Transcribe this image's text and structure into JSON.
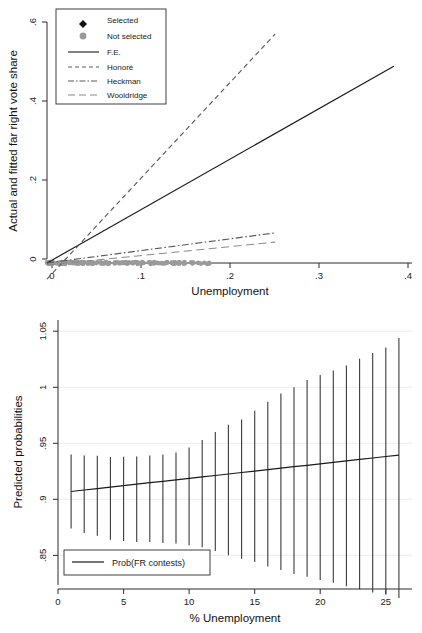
{
  "figure": {
    "caption_partial": "FIGURE 1  Estimates of vote share and contest"
  },
  "chart_data": [
    {
      "type": "scatter",
      "panel": "top",
      "title": "",
      "xlabel": "Unemployment",
      "ylabel": "Actual and fitted far right vote share",
      "xlim": [
        0,
        0.4
      ],
      "ylim": [
        0,
        0.6
      ],
      "xticks": [
        0,
        0.1,
        0.2,
        0.3,
        0.4
      ],
      "xticklabels": [
        "0",
        ".1",
        ".2",
        ".3",
        ".4"
      ],
      "yticks": [
        0,
        0.2,
        0.4,
        0.6
      ],
      "yticklabels": [
        "0",
        ".2",
        ".4",
        ".6"
      ],
      "grid": false,
      "legend_position": "top-left",
      "legend": [
        {
          "label": "Selected",
          "marker": "diamond",
          "color": "#111111"
        },
        {
          "label": "Not selected",
          "marker": "circle",
          "color": "#9a9a9a"
        },
        {
          "label": "F.E.",
          "marker": "line-solid",
          "color": "#1a1a1a"
        },
        {
          "label": "Honoré",
          "marker": "line-dashed",
          "color": "#5a5a5a"
        },
        {
          "label": "Heckman",
          "marker": "line-dashdot",
          "color": "#5a5a5a"
        },
        {
          "label": "Wooldridge",
          "marker": "line-longdash",
          "color": "#8a8a8a"
        }
      ],
      "fit_lines": [
        {
          "name": "F.E.",
          "style": "solid",
          "x": [
            0.0,
            0.38
          ],
          "y": [
            0.0,
            0.49
          ]
        },
        {
          "name": "Honoré",
          "style": "dashed",
          "x": [
            0.0,
            0.25
          ],
          "y": [
            -0.04,
            0.57
          ]
        },
        {
          "name": "Heckman",
          "style": "dashdot",
          "x": [
            0.0,
            0.25
          ],
          "y": [
            0.0,
            0.075
          ]
        },
        {
          "name": "Wooldridge",
          "style": "longdash",
          "x": [
            0.0,
            0.25
          ],
          "y": [
            -0.005,
            0.052
          ]
        }
      ],
      "series": [
        {
          "name": "Selected",
          "marker": "diamond",
          "color": "#111111",
          "n_points": 640,
          "note": "dense cluster at low unemployment, vote share 0 to .36; sparse tail to x=.21"
        },
        {
          "name": "Not selected",
          "marker": "circle",
          "color": "#9a9a9a",
          "n_points": 150,
          "note": "all lie on y = 0 baseline, x from 0 to .19"
        }
      ]
    },
    {
      "type": "line",
      "panel": "bottom",
      "title": "",
      "xlabel": "% Unemployment",
      "ylabel": "Predicted probabilities",
      "xlim": [
        0,
        27
      ],
      "ylim": [
        0.82,
        1.06
      ],
      "xticks": [
        0,
        5,
        10,
        15,
        20,
        25
      ],
      "xticklabels": [
        "0",
        "5",
        "10",
        "15",
        "20",
        "25"
      ],
      "yticks": [
        0.85,
        0.9,
        0.95,
        1,
        1.05
      ],
      "yticklabels": [
        ".85",
        ".9",
        ".95",
        "1",
        "1.05"
      ],
      "grid": true,
      "legend_position": "bottom-left",
      "legend": [
        {
          "label": "Prob(FR contests)",
          "marker": "line-solid",
          "color": "#1a1a1a"
        }
      ],
      "x": [
        1,
        2,
        3,
        4,
        5,
        6,
        7,
        8,
        9,
        10,
        11,
        12,
        13,
        14,
        15,
        16,
        17,
        18,
        19,
        20,
        21,
        22,
        23,
        24,
        25,
        26
      ],
      "values": [
        0.907,
        0.9083,
        0.9096,
        0.9109,
        0.9122,
        0.9135,
        0.9148,
        0.9161,
        0.9174,
        0.9187,
        0.92,
        0.9213,
        0.9226,
        0.9239,
        0.9252,
        0.9265,
        0.9278,
        0.9291,
        0.9304,
        0.9317,
        0.933,
        0.9343,
        0.9356,
        0.9369,
        0.9382,
        0.9395
      ],
      "ci_upper": [
        0.94,
        0.9392,
        0.9388,
        0.9378,
        0.938,
        0.9382,
        0.939,
        0.94,
        0.9418,
        0.9462,
        0.953,
        0.9602,
        0.9665,
        0.9712,
        0.979,
        0.987,
        0.9945,
        1.0,
        1.0065,
        1.011,
        1.015,
        1.0195,
        1.0255,
        1.0305,
        1.0355,
        1.044
      ],
      "ci_lower": [
        0.874,
        0.87,
        0.8675,
        0.864,
        0.8628,
        0.862,
        0.8618,
        0.861,
        0.8605,
        0.859,
        0.8572,
        0.854,
        0.8502,
        0.847,
        0.844,
        0.84,
        0.837,
        0.8335,
        0.831,
        0.828,
        0.8255,
        0.8225,
        0.8198,
        0.817,
        0.8148,
        0.812
      ],
      "series_name": "Prob(FR contests)"
    }
  ]
}
